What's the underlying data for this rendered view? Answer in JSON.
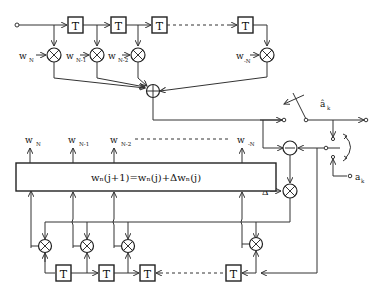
{
  "diagram": {
    "delay_label": "T",
    "top_filter": {
      "weights": [
        {
          "main": "w",
          "sub": "N"
        },
        {
          "main": "w",
          "sub": "N-1"
        },
        {
          "main": "w",
          "sub": "N-2"
        },
        {
          "main": "w",
          "sub": "-N"
        }
      ]
    },
    "update_block": {
      "equation": "wₙ(j+1)=wₙ(j)+Δwₙ(j)",
      "outputs": [
        {
          "main": "w",
          "sub": "N"
        },
        {
          "main": "w",
          "sub": "N-1"
        },
        {
          "main": "w",
          "sub": "N-2"
        },
        {
          "main": "w",
          "sub": "-N"
        }
      ]
    },
    "step_size_label": "Δ",
    "decision_output": {
      "main": "â",
      "sub": "k"
    },
    "training_input": {
      "main": "a",
      "sub": "k"
    },
    "symbols": {
      "multiplier": "multiply-icon",
      "summer": "sum-icon",
      "subtractor": "subtract-icon"
    }
  }
}
